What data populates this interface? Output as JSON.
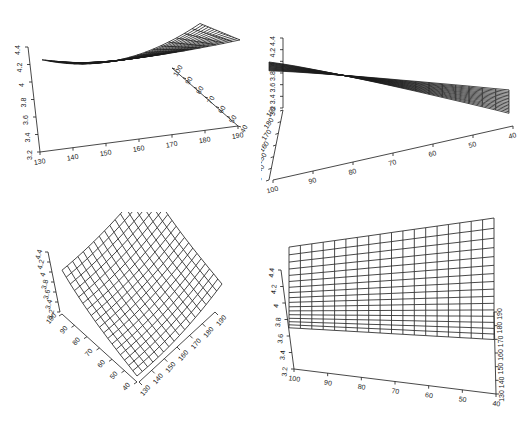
{
  "chart_data": [
    {
      "type": "surface3d",
      "panel": "top-left",
      "style": "wireframe",
      "grid": true,
      "legend": null,
      "title": "",
      "zlabel": "",
      "xlabel": "",
      "ylabel": "",
      "z_ticks": [
        "3.2",
        "3.4",
        "3.6",
        "3.8",
        "4",
        "4.2",
        "4.4"
      ],
      "x_ticks": [
        "130",
        "140",
        "150",
        "160",
        "170",
        "180",
        "190"
      ],
      "y_ticks": [
        "100",
        "90",
        "80",
        "70",
        "60",
        "50",
        "40"
      ],
      "zlim": [
        3.2,
        4.4
      ],
      "xlim": [
        130,
        190
      ],
      "ylim": [
        40,
        100
      ],
      "view": {
        "theta": -20,
        "phi": 20
      }
    },
    {
      "type": "surface3d",
      "panel": "top-right",
      "style": "wireframe",
      "grid": true,
      "legend": null,
      "title": "",
      "z_ticks": [
        "3.2",
        "3.4",
        "3.6",
        "3.8",
        "4",
        "4.2",
        "4.4"
      ],
      "x_ticks": [
        "100",
        "90",
        "80",
        "70",
        "60",
        "50",
        "40"
      ],
      "y_ticks": [
        "190",
        "180",
        "170",
        "160",
        "150",
        "140",
        "130"
      ],
      "zlim": [
        3.2,
        4.4
      ],
      "xlim": [
        40,
        100
      ],
      "ylim": [
        130,
        190
      ],
      "view": {
        "theta": 60,
        "phi": 30
      }
    },
    {
      "type": "surface3d",
      "panel": "bottom-left",
      "style": "wireframe",
      "grid": true,
      "legend": null,
      "title": "",
      "z_ticks": [
        "3.2",
        "3.4",
        "3.6",
        "3.8",
        "4",
        "4.2",
        "4.4"
      ],
      "x_ticks": [
        "130",
        "140",
        "150",
        "160",
        "170",
        "180",
        "190"
      ],
      "y_ticks": [
        "100",
        "90",
        "80",
        "70",
        "60",
        "50",
        "40"
      ],
      "zlim": [
        3.2,
        4.4
      ],
      "xlim": [
        130,
        190
      ],
      "ylim": [
        40,
        100
      ],
      "view": {
        "theta": -50,
        "phi": 30
      }
    },
    {
      "type": "surface3d",
      "panel": "bottom-right",
      "style": "wireframe",
      "grid": true,
      "legend": null,
      "title": "",
      "z_ticks": [
        "3.2",
        "3.4",
        "3.6",
        "3.8",
        "4",
        "4.2",
        "4.4"
      ],
      "x_ticks": [
        "100",
        "90",
        "80",
        "70",
        "60",
        "50",
        "40"
      ],
      "y_ticks": [
        "130",
        "140",
        "150",
        "160",
        "170",
        "180",
        "190"
      ],
      "zlim": [
        3.2,
        4.4
      ],
      "xlim": [
        40,
        100
      ],
      "ylim": [
        130,
        190
      ],
      "view": {
        "theta": 90,
        "phi": 20
      }
    }
  ],
  "colors": {
    "line": "#1a1a1a",
    "background": "#ffffff",
    "text": "#222222"
  }
}
